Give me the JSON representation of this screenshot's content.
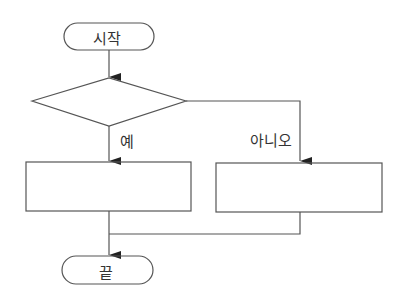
{
  "diagram": {
    "type": "flowchart",
    "nodes": {
      "start": {
        "shape": "terminal",
        "label": "시작"
      },
      "decision": {
        "shape": "diamond",
        "label": ""
      },
      "yes_process": {
        "shape": "rectangle",
        "label": ""
      },
      "no_process": {
        "shape": "rectangle",
        "label": ""
      },
      "end": {
        "shape": "terminal",
        "label": "끝"
      }
    },
    "edges": {
      "yes_label": "예",
      "no_label": "아니오"
    },
    "colors": {
      "stroke": "#555555",
      "text": "#333333",
      "background": "#ffffff"
    }
  }
}
